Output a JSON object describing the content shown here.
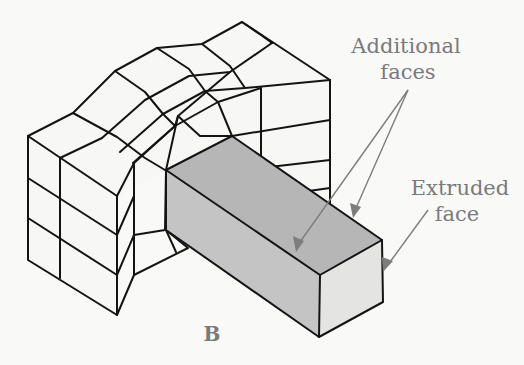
{
  "figure": {
    "panel_label": "B",
    "callouts": [
      {
        "id": "additional-faces",
        "lines": [
          "Additional",
          "faces"
        ],
        "arrow_count": 2
      },
      {
        "id": "extruded-face",
        "lines": [
          "Extruded",
          "face"
        ],
        "arrow_count": 1
      }
    ],
    "colors": {
      "background": "#f9f9f8",
      "edges": "#141414",
      "shaded_faces": "#b6b6b6",
      "extruded_face": "#e4e4e3",
      "label_text": "#7a7a7a",
      "leader_lines": "#7d7d7d"
    }
  }
}
